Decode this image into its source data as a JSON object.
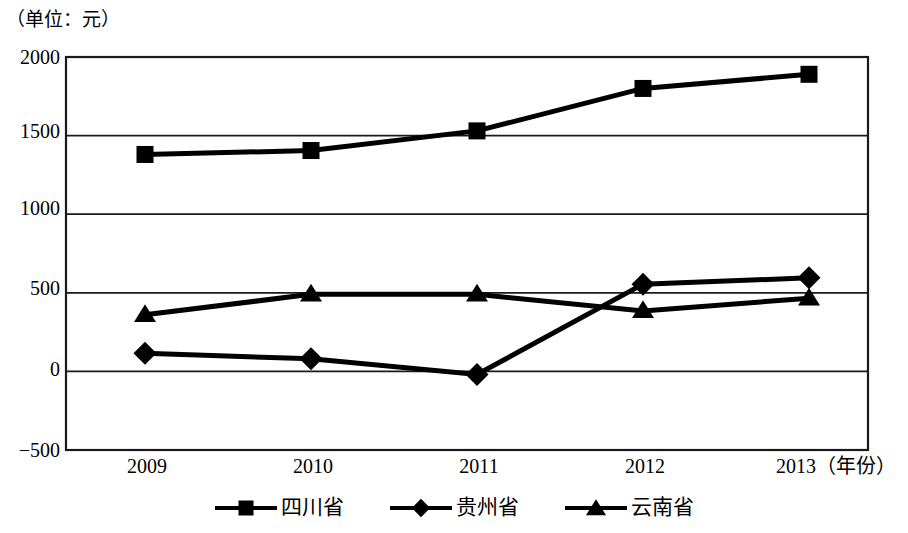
{
  "chart_data": {
    "type": "line",
    "title": "（单位：元）",
    "xlabel": "（年份）",
    "ylabel": "",
    "categories": [
      "2009",
      "2010",
      "2011",
      "2012",
      "2013"
    ],
    "x_tick_labels": [
      "2009",
      "2010",
      "2011",
      "2012",
      "2013（年份）"
    ],
    "y_tick_labels": [
      "2000",
      "1500",
      "1000",
      "500",
      "0",
      "−500"
    ],
    "y_ticks": [
      2000,
      1500,
      1000,
      500,
      0,
      -500
    ],
    "ylim": [
      -500,
      2000
    ],
    "grid": true,
    "legend_position": "bottom",
    "series": [
      {
        "name": "四川省",
        "marker": "square",
        "color": "#000000",
        "values": [
          1380,
          1405,
          1530,
          1800,
          1890
        ]
      },
      {
        "name": "贵州省",
        "marker": "diamond",
        "color": "#000000",
        "values": [
          115,
          80,
          -20,
          555,
          595
        ]
      },
      {
        "name": "云南省",
        "marker": "triangle",
        "color": "#000000",
        "values": [
          360,
          490,
          490,
          385,
          465
        ]
      }
    ]
  },
  "axis": {
    "unit_note": "（单位：元）",
    "y_labels": [
      "2000",
      "1500",
      "1000",
      "500",
      "0",
      "−500"
    ],
    "x_labels": [
      "2009",
      "2010",
      "2011",
      "2012",
      "2013（年份）"
    ]
  },
  "legend": {
    "items": [
      {
        "label": "四川省",
        "marker": "square-marker"
      },
      {
        "label": "贵州省",
        "marker": "diamond-marker"
      },
      {
        "label": "云南省",
        "marker": "triangle-marker"
      }
    ]
  }
}
